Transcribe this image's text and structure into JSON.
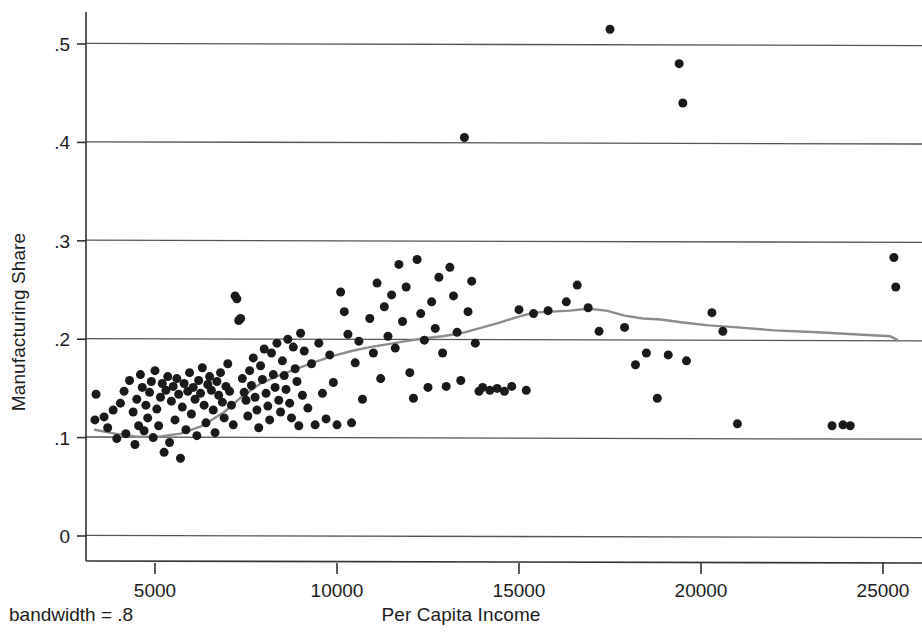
{
  "chart_data": {
    "type": "scatter",
    "title": "",
    "xlabel": "Per Capita Income",
    "ylabel": "Manufacturing Share",
    "annotation": "bandwidth = .8",
    "xlim": [
      3200,
      25700
    ],
    "ylim": [
      0,
      0.545
    ],
    "xticks": [
      5000,
      10000,
      15000,
      20000,
      25000
    ],
    "xtick_labels": [
      "5000",
      "10000",
      "15000",
      "20000",
      "25000"
    ],
    "yticks": [
      0,
      0.1,
      0.2,
      0.3,
      0.4,
      0.5
    ],
    "ytick_labels": [
      "0",
      ".1",
      ".2",
      ".3",
      ".4",
      ".5"
    ],
    "grid": "horizontal",
    "legend": "none",
    "marker": {
      "shape": "circle",
      "color": "#1a1a1a",
      "size_px": 9
    },
    "series": [
      {
        "name": "Manufacturing Share (observations)",
        "type": "scatter",
        "points": [
          [
            3350,
            0.118
          ],
          [
            3380,
            0.144
          ],
          [
            3600,
            0.121
          ],
          [
            3700,
            0.11
          ],
          [
            3850,
            0.128
          ],
          [
            3950,
            0.099
          ],
          [
            4050,
            0.135
          ],
          [
            4150,
            0.147
          ],
          [
            4200,
            0.104
          ],
          [
            4300,
            0.158
          ],
          [
            4400,
            0.126
          ],
          [
            4450,
            0.093
          ],
          [
            4500,
            0.139
          ],
          [
            4550,
            0.112
          ],
          [
            4600,
            0.164
          ],
          [
            4650,
            0.151
          ],
          [
            4700,
            0.107
          ],
          [
            4750,
            0.133
          ],
          [
            4800,
            0.12
          ],
          [
            4850,
            0.146
          ],
          [
            4900,
            0.157
          ],
          [
            4950,
            0.1
          ],
          [
            5000,
            0.168
          ],
          [
            5050,
            0.129
          ],
          [
            5100,
            0.112
          ],
          [
            5150,
            0.141
          ],
          [
            5200,
            0.155
          ],
          [
            5250,
            0.085
          ],
          [
            5300,
            0.148
          ],
          [
            5350,
            0.162
          ],
          [
            5400,
            0.095
          ],
          [
            5450,
            0.137
          ],
          [
            5500,
            0.152
          ],
          [
            5550,
            0.118
          ],
          [
            5600,
            0.16
          ],
          [
            5650,
            0.144
          ],
          [
            5700,
            0.079
          ],
          [
            5750,
            0.131
          ],
          [
            5800,
            0.155
          ],
          [
            5850,
            0.108
          ],
          [
            5900,
            0.147
          ],
          [
            5950,
            0.166
          ],
          [
            6000,
            0.124
          ],
          [
            6050,
            0.151
          ],
          [
            6100,
            0.139
          ],
          [
            6150,
            0.102
          ],
          [
            6200,
            0.158
          ],
          [
            6250,
            0.145
          ],
          [
            6300,
            0.171
          ],
          [
            6350,
            0.133
          ],
          [
            6400,
            0.115
          ],
          [
            6450,
            0.154
          ],
          [
            6500,
            0.162
          ],
          [
            6550,
            0.148
          ],
          [
            6600,
            0.128
          ],
          [
            6650,
            0.105
          ],
          [
            6700,
            0.157
          ],
          [
            6750,
            0.143
          ],
          [
            6800,
            0.166
          ],
          [
            6850,
            0.136
          ],
          [
            6900,
            0.12
          ],
          [
            6950,
            0.152
          ],
          [
            7000,
            0.175
          ],
          [
            7050,
            0.147
          ],
          [
            7100,
            0.133
          ],
          [
            7150,
            0.113
          ],
          [
            7200,
            0.244
          ],
          [
            7250,
            0.241
          ],
          [
            7300,
            0.219
          ],
          [
            7350,
            0.221
          ],
          [
            7400,
            0.16
          ],
          [
            7450,
            0.146
          ],
          [
            7500,
            0.138
          ],
          [
            7550,
            0.122
          ],
          [
            7600,
            0.168
          ],
          [
            7650,
            0.153
          ],
          [
            7700,
            0.181
          ],
          [
            7750,
            0.141
          ],
          [
            7800,
            0.128
          ],
          [
            7850,
            0.11
          ],
          [
            7900,
            0.173
          ],
          [
            7950,
            0.159
          ],
          [
            8000,
            0.19
          ],
          [
            8050,
            0.145
          ],
          [
            8100,
            0.132
          ],
          [
            8150,
            0.118
          ],
          [
            8200,
            0.186
          ],
          [
            8250,
            0.164
          ],
          [
            8300,
            0.151
          ],
          [
            8350,
            0.196
          ],
          [
            8400,
            0.138
          ],
          [
            8450,
            0.126
          ],
          [
            8500,
            0.178
          ],
          [
            8550,
            0.163
          ],
          [
            8600,
            0.149
          ],
          [
            8650,
            0.2
          ],
          [
            8700,
            0.135
          ],
          [
            8750,
            0.12
          ],
          [
            8800,
            0.192
          ],
          [
            8850,
            0.17
          ],
          [
            8900,
            0.157
          ],
          [
            8950,
            0.112
          ],
          [
            9000,
            0.206
          ],
          [
            9050,
            0.143
          ],
          [
            9100,
            0.188
          ],
          [
            9200,
            0.13
          ],
          [
            9300,
            0.175
          ],
          [
            9400,
            0.113
          ],
          [
            9500,
            0.196
          ],
          [
            9600,
            0.145
          ],
          [
            9700,
            0.119
          ],
          [
            9800,
            0.184
          ],
          [
            9900,
            0.156
          ],
          [
            10000,
            0.113
          ],
          [
            10100,
            0.248
          ],
          [
            10200,
            0.228
          ],
          [
            10300,
            0.205
          ],
          [
            10400,
            0.115
          ],
          [
            10500,
            0.176
          ],
          [
            10600,
            0.198
          ],
          [
            10700,
            0.139
          ],
          [
            10900,
            0.221
          ],
          [
            11000,
            0.186
          ],
          [
            11100,
            0.257
          ],
          [
            11200,
            0.16
          ],
          [
            11300,
            0.233
          ],
          [
            11400,
            0.203
          ],
          [
            11500,
            0.245
          ],
          [
            11600,
            0.191
          ],
          [
            11700,
            0.276
          ],
          [
            11800,
            0.218
          ],
          [
            11900,
            0.253
          ],
          [
            12000,
            0.166
          ],
          [
            12100,
            0.14
          ],
          [
            12200,
            0.281
          ],
          [
            12300,
            0.226
          ],
          [
            12400,
            0.199
          ],
          [
            12500,
            0.151
          ],
          [
            12600,
            0.238
          ],
          [
            12700,
            0.211
          ],
          [
            12800,
            0.263
          ],
          [
            12900,
            0.186
          ],
          [
            13000,
            0.152
          ],
          [
            13100,
            0.273
          ],
          [
            13200,
            0.244
          ],
          [
            13300,
            0.207
          ],
          [
            13400,
            0.158
          ],
          [
            13500,
            0.405
          ],
          [
            13600,
            0.228
          ],
          [
            13700,
            0.259
          ],
          [
            13800,
            0.196
          ],
          [
            13900,
            0.147
          ],
          [
            14000,
            0.151
          ],
          [
            14200,
            0.148
          ],
          [
            14400,
            0.15
          ],
          [
            14600,
            0.147
          ],
          [
            14800,
            0.152
          ],
          [
            15000,
            0.23
          ],
          [
            15200,
            0.148
          ],
          [
            15400,
            0.226
          ],
          [
            15800,
            0.229
          ],
          [
            16300,
            0.238
          ],
          [
            16600,
            0.255
          ],
          [
            16900,
            0.232
          ],
          [
            17200,
            0.208
          ],
          [
            17500,
            0.515
          ],
          [
            17900,
            0.212
          ],
          [
            18200,
            0.174
          ],
          [
            18500,
            0.186
          ],
          [
            18800,
            0.14
          ],
          [
            19100,
            0.184
          ],
          [
            19400,
            0.48
          ],
          [
            19500,
            0.44
          ],
          [
            19600,
            0.178
          ],
          [
            20300,
            0.227
          ],
          [
            20600,
            0.208
          ],
          [
            21000,
            0.114
          ],
          [
            23600,
            0.112
          ],
          [
            23900,
            0.113
          ],
          [
            24100,
            0.112
          ],
          [
            25300,
            0.283
          ],
          [
            25350,
            0.253
          ]
        ]
      },
      {
        "name": "lowess smoother",
        "type": "line",
        "color": "#8c8c8c",
        "points": [
          [
            3350,
            0.108
          ],
          [
            3900,
            0.104
          ],
          [
            4500,
            0.101
          ],
          [
            5100,
            0.101
          ],
          [
            5700,
            0.104
          ],
          [
            6300,
            0.112
          ],
          [
            6900,
            0.126
          ],
          [
            7400,
            0.142
          ],
          [
            7900,
            0.155
          ],
          [
            8400,
            0.163
          ],
          [
            8900,
            0.17
          ],
          [
            9400,
            0.177
          ],
          [
            9900,
            0.183
          ],
          [
            10400,
            0.188
          ],
          [
            10900,
            0.192
          ],
          [
            11400,
            0.195
          ],
          [
            11900,
            0.198
          ],
          [
            12400,
            0.201
          ],
          [
            12900,
            0.203
          ],
          [
            13400,
            0.206
          ],
          [
            13900,
            0.211
          ],
          [
            14400,
            0.216
          ],
          [
            14900,
            0.222
          ],
          [
            15400,
            0.227
          ],
          [
            15900,
            0.228
          ],
          [
            16400,
            0.229
          ],
          [
            16900,
            0.231
          ],
          [
            17400,
            0.229
          ],
          [
            17900,
            0.224
          ],
          [
            18400,
            0.221
          ],
          [
            18900,
            0.22
          ],
          [
            19500,
            0.217
          ],
          [
            20200,
            0.214
          ],
          [
            21000,
            0.212
          ],
          [
            22000,
            0.209
          ],
          [
            23200,
            0.207
          ],
          [
            24200,
            0.205
          ],
          [
            25200,
            0.203
          ],
          [
            25400,
            0.199
          ]
        ]
      }
    ]
  },
  "axes": {
    "x_title": "Per Capita Income",
    "y_title": "Manufacturing Share"
  },
  "footer": {
    "bandwidth_note": "bandwidth = .8"
  },
  "colors": {
    "marker": "#1a1a1a",
    "smoother": "#8c8c8c",
    "grid": "#555555",
    "axis": "#333333",
    "background": "#ffffff",
    "text": "#1c1c1c"
  }
}
